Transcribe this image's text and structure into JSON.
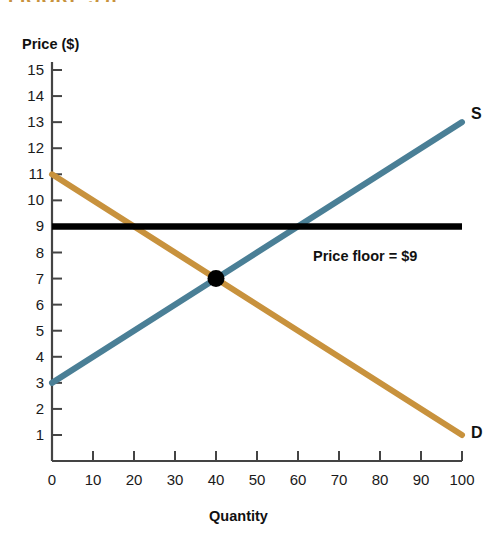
{
  "figure": {
    "title_fragment": "FIGURE 5.8",
    "title_color": "#c8923d"
  },
  "axes": {
    "y_axis_label": "Price ($)",
    "x_axis_label": "Quantity",
    "y_ticks": [
      "15",
      "14",
      "13",
      "12",
      "11",
      "10",
      "9",
      "8",
      "7",
      "6",
      "5",
      "4",
      "3",
      "2",
      "1"
    ],
    "x_ticks": [
      "0",
      "10",
      "20",
      "30",
      "40",
      "50",
      "60",
      "70",
      "80",
      "90",
      "100"
    ]
  },
  "annotations": {
    "supply_label": "S",
    "demand_label": "D",
    "price_floor_label": "Price floor = $9"
  },
  "colors": {
    "supply": "#4a7f96",
    "demand": "#c8923d",
    "price_floor": "#000000",
    "equilibrium_point": "#000000",
    "axis": "#444444"
  },
  "chart_data": {
    "type": "line",
    "title": "FIGURE 5.8",
    "xlabel": "Quantity",
    "ylabel": "Price ($)",
    "xlim": [
      0,
      100
    ],
    "ylim": [
      0,
      15
    ],
    "grid": false,
    "legend": "inline-curve-labels",
    "x_tick_values": [
      0,
      10,
      20,
      30,
      40,
      50,
      60,
      70,
      80,
      90,
      100
    ],
    "y_tick_values": [
      1,
      2,
      3,
      4,
      5,
      6,
      7,
      8,
      9,
      10,
      11,
      12,
      13,
      14,
      15
    ],
    "series": [
      {
        "name": "S",
        "label": "Supply",
        "color": "#4a7f96",
        "x": [
          0,
          100
        ],
        "values": [
          3,
          13
        ],
        "slope": 0.1,
        "intercept": 3
      },
      {
        "name": "D",
        "label": "Demand",
        "color": "#c8923d",
        "x": [
          0,
          100
        ],
        "values": [
          11,
          1
        ],
        "slope": -0.1,
        "intercept": 11
      },
      {
        "name": "Price floor = $9",
        "label": "Price floor",
        "color": "#000000",
        "x": [
          0,
          100
        ],
        "values": [
          9,
          9
        ],
        "slope": 0,
        "intercept": 9
      }
    ],
    "annotations": [
      {
        "type": "point",
        "label": "equilibrium",
        "x": 40,
        "y": 7,
        "color": "#000000"
      },
      {
        "type": "text",
        "label": "S",
        "x": 100,
        "y": 13
      },
      {
        "type": "text",
        "label": "D",
        "x": 100,
        "y": 1
      },
      {
        "type": "text",
        "label": "Price floor = $9",
        "x": 62,
        "y": 8.3
      }
    ],
    "derived": {
      "equilibrium_quantity": 40,
      "equilibrium_price": 7,
      "price_floor": 9,
      "quantity_demanded_at_floor": 20,
      "quantity_supplied_at_floor": 60,
      "surplus": 40
    }
  }
}
